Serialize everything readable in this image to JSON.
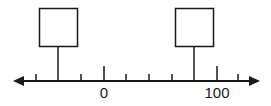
{
  "number_line": {
    "axis": {
      "y": 81,
      "x_start": 15,
      "x_end": 258,
      "color": "#1a1a1a"
    },
    "ticks": [
      {
        "x": 36,
        "label": "",
        "major": false
      },
      {
        "x": 81,
        "label": "",
        "major": false
      },
      {
        "x": 104,
        "label": "0",
        "major": true
      },
      {
        "x": 126,
        "label": "",
        "major": false
      },
      {
        "x": 149,
        "label": "",
        "major": false
      },
      {
        "x": 172,
        "label": "",
        "major": false
      },
      {
        "x": 217,
        "label": "100",
        "major": true
      },
      {
        "x": 238,
        "label": "",
        "major": false
      }
    ],
    "labels": {
      "zero": "0",
      "hundred": "100"
    },
    "answer_boxes": [
      {
        "id": "box-left",
        "x": 39,
        "y": 8,
        "size": 38,
        "stem_x": 58,
        "value": ""
      },
      {
        "id": "box-right",
        "x": 175,
        "y": 8,
        "size": 38,
        "stem_x": 194,
        "value": ""
      }
    ]
  }
}
